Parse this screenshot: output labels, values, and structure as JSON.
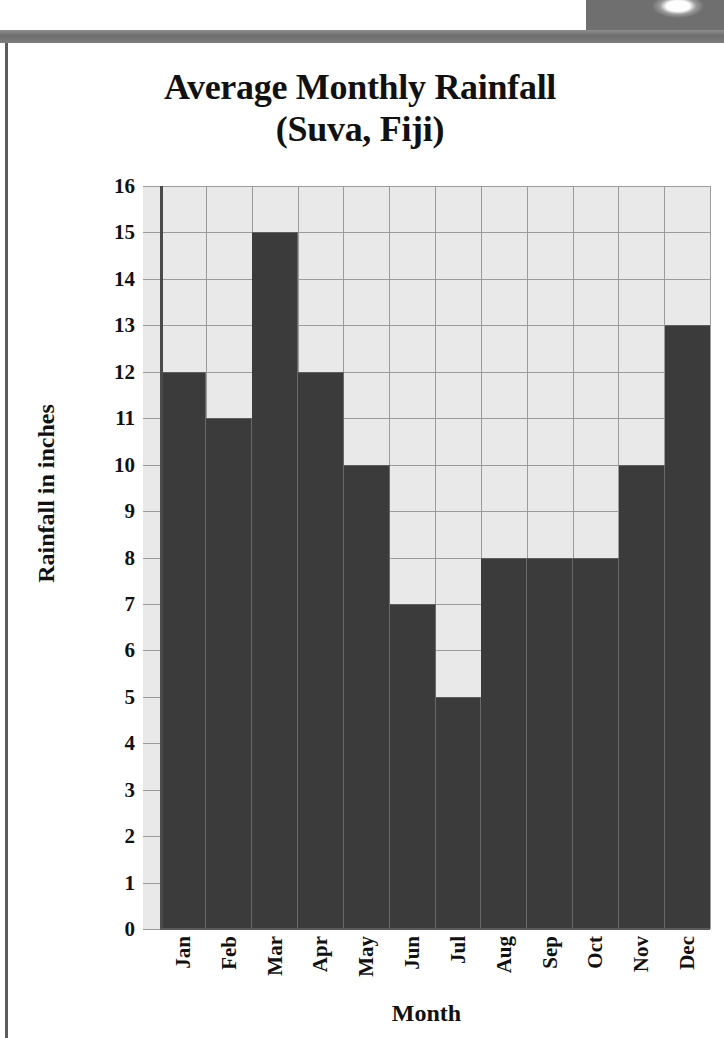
{
  "page": {
    "background_color": "#ffffff",
    "border_color": "#5c5c5c",
    "band_color": "#6d6d6d"
  },
  "title": {
    "line1": "Average Monthly Rainfall",
    "line2": "(Suva, Fiji)"
  },
  "chart_data": {
    "type": "bar",
    "title": "Average Monthly Rainfall (Suva, Fiji)",
    "categories": [
      "Jan",
      "Feb",
      "Mar",
      "Apr",
      "May",
      "Jun",
      "Jul",
      "Aug",
      "Sep",
      "Oct",
      "Nov",
      "Dec"
    ],
    "values": [
      12,
      11,
      15,
      12,
      10,
      7,
      5,
      8,
      8,
      8,
      10,
      13
    ],
    "xlabel": "Month",
    "ylabel": "Rainfall in inches",
    "ylim": [
      0,
      16
    ],
    "ytick_labels": [
      "16",
      "15",
      "14",
      "13",
      "12",
      "11",
      "10",
      "9",
      "8",
      "7",
      "6",
      "5",
      "4",
      "3",
      "2",
      "1",
      "0"
    ],
    "ytick_values": [
      16,
      15,
      14,
      13,
      12,
      11,
      10,
      9,
      8,
      7,
      6,
      5,
      4,
      3,
      2,
      1,
      0
    ],
    "ytick_step": 1,
    "grid": true,
    "legend": "none",
    "bar_color": "#3b3b3b",
    "plot_background_color": "#e9e9e9",
    "gridline_color": "#9b9b9b",
    "axis_color": "#4a4a4a"
  }
}
